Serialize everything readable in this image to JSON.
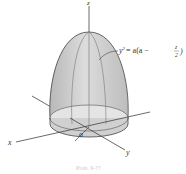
{
  "figure": {
    "axes": {
      "x_label": "x",
      "y_label": "y",
      "z_label": "z"
    },
    "radius_label": "a",
    "equation": {
      "lhs": "y",
      "exponent": "2",
      "rhs_prefix": "= a(a −",
      "fraction_num": "z",
      "fraction_den": "2",
      "rhs_suffix": ")"
    },
    "caption": "Prob. 9-??",
    "colors": {
      "surface_fill": "#d4d4d4",
      "surface_dark": "#b5b5b5",
      "base_fill": "#e6e6e6",
      "line": "#444444"
    }
  }
}
